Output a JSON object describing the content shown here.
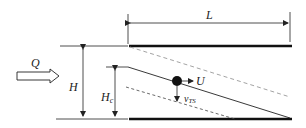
{
  "diagram": {
    "labels": {
      "flow": "Q",
      "length": "L",
      "depth": "H",
      "depth_c_main": "H",
      "depth_c_sub": "c",
      "velocity": "U",
      "settling_main": "v",
      "settling_sub": "TS"
    },
    "colors": {
      "line": "#222222",
      "dashed": "#9a9a9a"
    }
  }
}
